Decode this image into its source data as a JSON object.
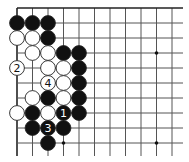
{
  "board": {
    "type": "go-diagram",
    "origin_x": 17,
    "origin_y": 8,
    "spacing_x": 15.5,
    "spacing_y": 15,
    "columns": 11,
    "rows": 10,
    "line_extend_right": 183,
    "line_extend_bottom": 156,
    "edges": {
      "top": true,
      "left": true
    },
    "line_color": "#555555",
    "edge_color": "#222222",
    "stone_radius": 7.4,
    "colors": {
      "black": "#111111",
      "white": "#ffffff",
      "stone_outline": "#222222"
    },
    "hoshi": [
      {
        "col": 3,
        "row": 3
      },
      {
        "col": 9,
        "row": 3
      },
      {
        "col": 3,
        "row": 9
      },
      {
        "col": 9,
        "row": 9
      }
    ],
    "hoshi_visible": [
      {
        "col": 9,
        "row": 3
      },
      {
        "col": 3,
        "row": 9
      },
      {
        "col": 9,
        "row": 9
      }
    ],
    "stones": [
      {
        "color": "black",
        "col": 0,
        "row": 1
      },
      {
        "color": "black",
        "col": 1,
        "row": 1
      },
      {
        "color": "black",
        "col": 2,
        "row": 1
      },
      {
        "color": "white",
        "col": 0,
        "row": 2
      },
      {
        "color": "white",
        "col": 1,
        "row": 2
      },
      {
        "color": "black",
        "col": 2,
        "row": 2
      },
      {
        "color": "white",
        "col": 1,
        "row": 3
      },
      {
        "color": "white",
        "col": 2,
        "row": 3
      },
      {
        "color": "black",
        "col": 3,
        "row": 3
      },
      {
        "color": "black",
        "col": 4,
        "row": 3
      },
      {
        "color": "white",
        "col": 0,
        "row": 4,
        "label": "2"
      },
      {
        "color": "white",
        "col": 2,
        "row": 4
      },
      {
        "color": "white",
        "col": 3,
        "row": 4
      },
      {
        "color": "black",
        "col": 4,
        "row": 4
      },
      {
        "color": "white",
        "col": 2,
        "row": 5,
        "label": "4"
      },
      {
        "color": "white",
        "col": 3,
        "row": 5
      },
      {
        "color": "black",
        "col": 4,
        "row": 5
      },
      {
        "color": "white",
        "col": 1,
        "row": 6
      },
      {
        "color": "black",
        "col": 2,
        "row": 6
      },
      {
        "color": "white",
        "col": 3,
        "row": 6
      },
      {
        "color": "black",
        "col": 4,
        "row": 6
      },
      {
        "color": "white",
        "col": 0,
        "row": 7
      },
      {
        "color": "black",
        "col": 1,
        "row": 7
      },
      {
        "color": "white",
        "col": 2,
        "row": 7
      },
      {
        "color": "black",
        "col": 3,
        "row": 7,
        "label": "1"
      },
      {
        "color": "black",
        "col": 4,
        "row": 7
      },
      {
        "color": "black",
        "col": 1,
        "row": 8
      },
      {
        "color": "black",
        "col": 2,
        "row": 8,
        "label": "3"
      },
      {
        "color": "black",
        "col": 3,
        "row": 8
      },
      {
        "color": "black",
        "col": 2,
        "row": 9
      }
    ],
    "move_labels": [
      "1",
      "2",
      "3",
      "4"
    ]
  }
}
